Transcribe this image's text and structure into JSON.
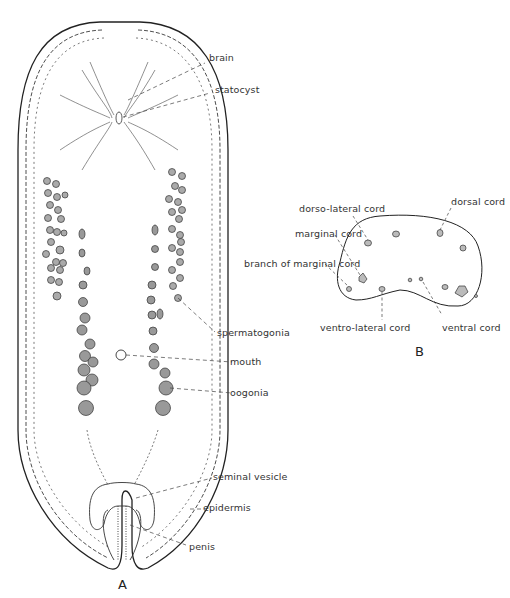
{
  "figure_a": {
    "label": "A",
    "annotations": {
      "brain": "brain",
      "statocyst": "statocyst",
      "spermatogonia": "spermatogonia",
      "mouth": "mouth",
      "oogonia": "oogonia",
      "seminal_vesicle": "seminal vesicle",
      "epidermis": "epidermis",
      "penis": "penis"
    }
  },
  "figure_b": {
    "label": "B",
    "annotations": {
      "dorso_lateral_cord": "dorso-lateral cord",
      "dorsal_cord": "dorsal cord",
      "marginal_cord": "marginal cord",
      "branch_of_marginal_cord": "branch of marginal cord",
      "ventro_lateral_cord": "ventro-lateral cord",
      "ventral_cord": "ventral cord"
    }
  }
}
